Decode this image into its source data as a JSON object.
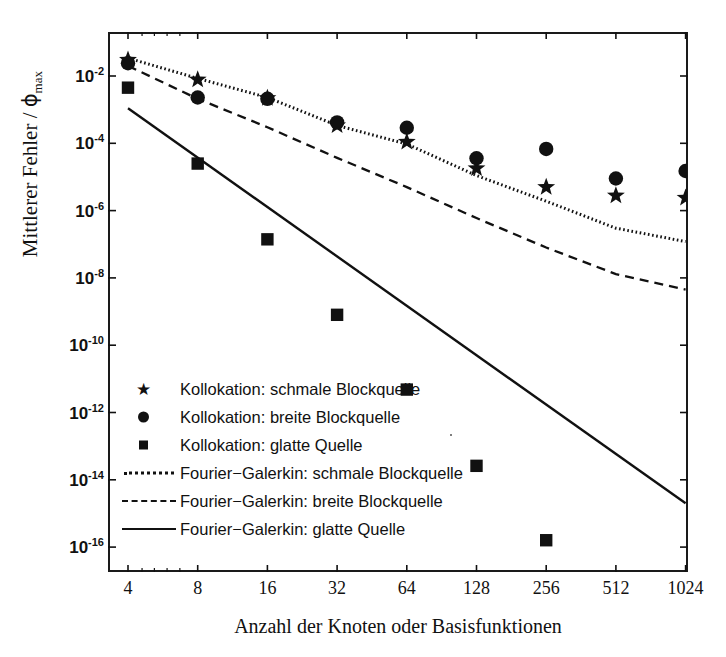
{
  "axes": {
    "ylabel_main": "Mittlerer Fehler / ",
    "ylabel_phi": "ϕ",
    "ylabel_sub": "max",
    "xlabel": "Anzahl der Knoten oder Basisfunktionen",
    "ytick_labels": [
      "10-2",
      "10-4",
      "10-6",
      "10-8",
      "10-10",
      "10-12",
      "10-14",
      "10-16"
    ],
    "ytick_mantissa": "10",
    "ytick_exponents": [
      "-2",
      "-4",
      "-6",
      "-8",
      "-10",
      "-12",
      "-14",
      "-16"
    ],
    "xtick_labels": [
      "4",
      "8",
      "16",
      "32",
      "64",
      "128",
      "256",
      "512",
      "1024"
    ]
  },
  "legend": {
    "entries": [
      {
        "symbol": "star-marker",
        "label": "Kollokation: schmale Blockquelle"
      },
      {
        "symbol": "circle-marker",
        "label": "Kollokation: breite Blockquelle"
      },
      {
        "symbol": "square-marker",
        "label": "Kollokation: glatte Quelle"
      },
      {
        "symbol": "dotted-line",
        "label": "Fourier−Galerkin: schmale Blockquelle"
      },
      {
        "symbol": "dashed-line",
        "label": "Fourier−Galerkin: breite Blockquelle"
      },
      {
        "symbol": "solid-line",
        "label": "Fourier−Galerkin: glatte Quelle"
      }
    ]
  },
  "colors": {
    "ink": "#111111",
    "frame": "#1a1a1a",
    "background": "#ffffff"
  },
  "chart_data": {
    "type": "scatter",
    "title": "",
    "xlabel": "Anzahl der Knoten oder Basisfunktionen",
    "ylabel": "Mittlerer Fehler / ϕmax",
    "xscale": "log2",
    "yscale": "log10",
    "xlim": [
      3.3,
      1250
    ],
    "ylim": [
      1e-16,
      0.042
    ],
    "xticks": [
      4,
      8,
      16,
      32,
      64,
      128,
      256,
      512,
      1024
    ],
    "yticks": [
      0.01,
      0.0001,
      1e-06,
      1e-08,
      1e-10,
      1e-12,
      1e-14,
      1e-16
    ],
    "grid": false,
    "legend_position": "lower-left-inside",
    "series": [
      {
        "name": "Kollokation: schmale Blockquelle",
        "marker": "star",
        "style": "markers",
        "x": [
          4,
          8,
          16,
          32,
          64,
          128,
          256,
          512,
          1024
        ],
        "y": [
          0.03,
          0.0078,
          0.0022,
          0.00034,
          0.00011,
          1.8e-05,
          5e-06,
          2.8e-06,
          2.4e-06
        ]
      },
      {
        "name": "Kollokation: breite Blockquelle",
        "marker": "circle",
        "style": "markers",
        "x": [
          4,
          8,
          16,
          32,
          64,
          128,
          256,
          512,
          1024
        ],
        "y": [
          0.024,
          0.0023,
          0.0021,
          0.00042,
          0.00029,
          3.6e-05,
          6.8e-05,
          9e-06,
          1.5e-05
        ]
      },
      {
        "name": "Kollokation: glatte Quelle",
        "marker": "square",
        "style": "markers",
        "x": [
          4,
          8,
          16,
          32,
          64,
          128,
          256,
          512,
          1024
        ],
        "y": [
          0.0045,
          2.5e-05,
          1.4e-07,
          8e-10,
          4.8e-12,
          2.6e-14,
          1.6e-16,
          1e-18,
          5.5e-21
        ]
      },
      {
        "name": "Fourier−Galerkin: schmale Blockquelle",
        "marker": "none",
        "style": "dotted",
        "x": [
          4,
          8,
          16,
          32,
          64,
          128,
          256,
          512,
          1024
        ],
        "y": [
          0.034,
          0.0085,
          0.0023,
          0.00034,
          9.5e-05,
          1.1e-05,
          1.9e-06,
          3e-07,
          1.2e-07
        ]
      },
      {
        "name": "Fourier−Galerkin: breite Blockquelle",
        "marker": "none",
        "style": "dashed",
        "x": [
          4,
          8,
          16,
          32,
          64,
          128,
          256,
          512,
          1024
        ],
        "y": [
          0.02,
          0.0021,
          0.0003,
          3.7e-05,
          5e-06,
          6e-07,
          8e-08,
          1.3e-08,
          4.5e-09
        ]
      },
      {
        "name": "Fourier−Galerkin: glatte Quelle",
        "marker": "none",
        "style": "solid",
        "x": [
          4,
          1024
        ],
        "y": [
          0.0011,
          2e-15
        ]
      }
    ]
  }
}
